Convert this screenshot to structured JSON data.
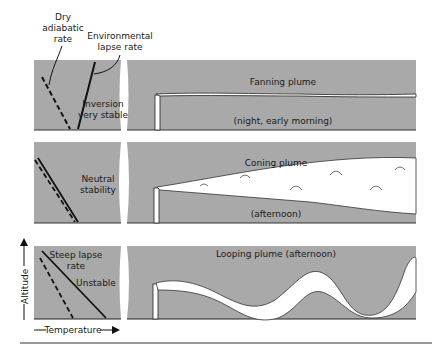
{
  "header": {
    "dry_adiabatic_line1": "Dry",
    "dry_adiabatic_line2": "adiabatic",
    "dry_adiabatic_line3": "rate",
    "env_lapse_line1": "Environmental",
    "env_lapse_line2": "lapse rate"
  },
  "panels": [
    {
      "stability_line1": "Inversion",
      "stability_line2": "very stable",
      "plume_title": "Fanning plume",
      "time_note": "(night, early morning)"
    },
    {
      "stability_line1": "Neutral",
      "stability_line2": "stability",
      "plume_title": "Coning plume",
      "time_note": "(afternoon)"
    },
    {
      "stability_line1": "Steep lapse",
      "stability_line2": "rate",
      "stability_line3": "Unstable",
      "plume_title": "Looping plume (afternoon)"
    }
  ],
  "axes": {
    "y_label": "Altitude",
    "x_label": "Temperature"
  },
  "colors": {
    "panel_gray": "#a9a9a9",
    "line": "#111111",
    "plume": "#ffffff"
  }
}
